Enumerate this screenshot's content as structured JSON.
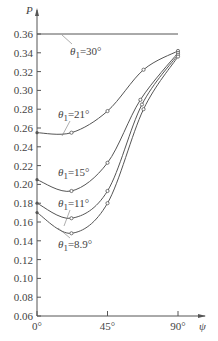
{
  "chart_data": {
    "type": "line",
    "title": "",
    "xlabel": "ψ",
    "ylabel": "P",
    "xlim": [
      0,
      90
    ],
    "ylim": [
      0.06,
      0.36
    ],
    "x_ticks": [
      "0°",
      "45°",
      "90°"
    ],
    "y_ticks": [
      "0.06",
      "0.08",
      "0.10",
      "0.12",
      "0.14",
      "0.16",
      "0.18",
      "0.20",
      "0.22",
      "0.24",
      "0.26",
      "0.28",
      "0.30",
      "0.32",
      "0.34",
      "0.36"
    ],
    "grid": false,
    "legend": "inline labels",
    "series": [
      {
        "name": "θ1=30°",
        "label": "θ1=30°",
        "x": [
          0,
          90
        ],
        "values": [
          0.36,
          0.36
        ],
        "markers": false
      },
      {
        "name": "θ1=21°",
        "label": "θ1=21°",
        "x": [
          0,
          22,
          45,
          68,
          90
        ],
        "values": [
          0.255,
          0.255,
          0.278,
          0.322,
          0.342
        ],
        "markers": true
      },
      {
        "name": "θ1=15°",
        "label": "θ1=15°",
        "x": [
          0,
          22,
          45,
          66,
          90
        ],
        "values": [
          0.205,
          0.193,
          0.223,
          0.29,
          0.34
        ],
        "markers": true
      },
      {
        "name": "θ1=11°",
        "label": "θ1=11°",
        "x": [
          0,
          22,
          45,
          67,
          90
        ],
        "values": [
          0.18,
          0.164,
          0.193,
          0.285,
          0.338
        ],
        "markers": true
      },
      {
        "name": "θ1=8.9°",
        "label": "θ1=8.9°",
        "x": [
          0,
          22,
          45,
          68,
          90
        ],
        "values": [
          0.17,
          0.148,
          0.18,
          0.28,
          0.336
        ],
        "markers": true
      }
    ]
  }
}
